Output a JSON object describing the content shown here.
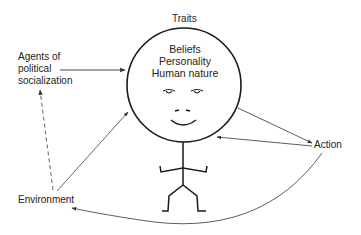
{
  "diagram": {
    "top_label": "Traits",
    "inner_text": [
      "Beliefs",
      "Personality",
      "Human nature"
    ],
    "nodes": {
      "agents": [
        "Agents of",
        "political",
        "socialization"
      ],
      "environment": "Environment",
      "action": "Action"
    },
    "edges": [
      {
        "from": "Agents of political socialization",
        "to": "Person (head)",
        "style": "solid"
      },
      {
        "from": "Environment",
        "to": "Agents of political socialization",
        "style": "dashed"
      },
      {
        "from": "Environment",
        "to": "Person (head)",
        "style": "solid"
      },
      {
        "from": "Person (head)",
        "to": "Action",
        "style": "solid"
      },
      {
        "from": "Action",
        "to": "Person (head)",
        "style": "solid"
      },
      {
        "from": "Action",
        "to": "Environment",
        "style": "solid-curved"
      }
    ],
    "colors": {
      "stroke": "#222222",
      "arrow": "#555555",
      "text": "#222222"
    }
  }
}
